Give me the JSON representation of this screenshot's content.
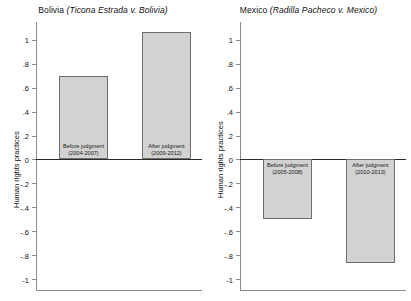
{
  "chart_data": [
    {
      "type": "bar",
      "title": "Bolivia (Ticona Estrada v. Bolivia)",
      "title_country": "Bolivia ",
      "title_case": "(Ticona Estrada v. Bolivia)",
      "ylabel": "Human rights practices",
      "xlabel": "",
      "ylim": [
        -1.1,
        1.15
      ],
      "yticks": [
        1,
        0.8,
        0.6,
        0.4,
        0.2,
        0,
        -0.2,
        -0.4,
        -0.6,
        -0.8,
        -1
      ],
      "ytick_labels": [
        "1",
        ".8",
        ".6",
        ".4",
        ".2",
        "0",
        "-.2",
        "-.4",
        "-.6",
        "-.8",
        "-1"
      ],
      "grid": false,
      "legend": "none",
      "categories": [
        "Before judgment\n(2004-2007)",
        "After judgment\n(2009-2012)"
      ],
      "bars": [
        {
          "label_line1": "Before judgment",
          "label_line2": "(2004-2007)",
          "value": 0.7
        },
        {
          "label_line1": "After judgment",
          "label_line2": "(2009-2012)",
          "value": 1.07
        }
      ],
      "values": [
        0.7,
        1.07
      ],
      "bar_fill": "#d2d2d2",
      "bar_border": "#6f6f6f"
    },
    {
      "type": "bar",
      "title": "Mexico (Radilla Pacheco v. Mexico)",
      "title_country": "Mexico ",
      "title_case": "(Radilla Pacheco v. Mexico)",
      "ylabel": "Human rights practices",
      "xlabel": "",
      "ylim": [
        -1.1,
        1.15
      ],
      "yticks": [
        1,
        0.8,
        0.6,
        0.4,
        0.2,
        0,
        -0.2,
        -0.4,
        -0.6,
        -0.8,
        -1
      ],
      "ytick_labels": [
        "1",
        ".8",
        ".6",
        ".4",
        ".2",
        "0",
        "-.2",
        "-.4",
        "-.6",
        "-.8",
        "-1"
      ],
      "grid": false,
      "legend": "none",
      "categories": [
        "Before judgment\n(2005-2008)",
        "After judgment\n(2010-2013)"
      ],
      "bars": [
        {
          "label_line1": "Before judgment",
          "label_line2": "(2005-2008)",
          "value": -0.5
        },
        {
          "label_line1": "After judgment",
          "label_line2": "(2010-2013)",
          "value": -0.87
        }
      ],
      "values": [
        -0.5,
        -0.87
      ],
      "bar_fill": "#d2d2d2",
      "bar_border": "#6f6f6f"
    }
  ]
}
